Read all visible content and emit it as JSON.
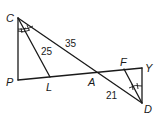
{
  "diagram": {
    "type": "geometry",
    "points": {
      "C": {
        "label": "C",
        "x": 18,
        "y": 18
      },
      "P": {
        "label": "P",
        "x": 18,
        "y": 80
      },
      "L": {
        "label": "L",
        "x": 50,
        "y": 77
      },
      "A": {
        "label": "A",
        "x": 92,
        "y": 72
      },
      "F": {
        "label": "F",
        "x": 124,
        "y": 69
      },
      "Y": {
        "label": "Y",
        "x": 142,
        "y": 68
      },
      "D": {
        "label": "D",
        "x": 142,
        "y": 103
      }
    },
    "segments": [
      [
        "C",
        "P"
      ],
      [
        "P",
        "Y"
      ],
      [
        "C",
        "D"
      ],
      [
        "C",
        "L"
      ],
      [
        "D",
        "F"
      ],
      [
        "Y",
        "D"
      ]
    ],
    "measurements": {
      "CL": "25",
      "CA": "35",
      "AD": "21"
    },
    "congruent_angles": [
      {
        "vertex": "C",
        "between": [
          "P",
          "L",
          "A"
        ],
        "marks": 1
      },
      {
        "vertex": "D",
        "between": [
          "A",
          "F",
          "Y"
        ],
        "marks": 1
      }
    ]
  }
}
